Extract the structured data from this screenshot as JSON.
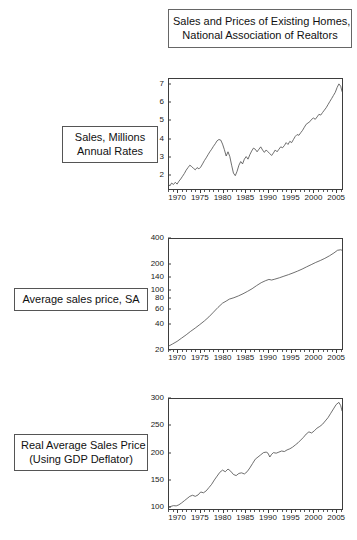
{
  "title": {
    "line1": "Sales and Prices of Existing Homes,",
    "line2": "National Association of Realtors"
  },
  "captions": [
    {
      "line1": "Sales, Millions",
      "line2": "Annual Rates"
    },
    {
      "line1": "Average sales price, SA",
      "line2": ""
    },
    {
      "line1": "Real Average Sales Price",
      "line2": "(Using GDP Deflator)"
    }
  ],
  "chart_data": [
    {
      "type": "line",
      "title": "Sales, Millions Annual Rates",
      "xlabel": "",
      "ylabel": "",
      "scale": "linear",
      "grid": false,
      "legend": null,
      "xlim": [
        1968,
        2006.5
      ],
      "ylim": [
        1.2,
        7.3
      ],
      "yticks": [
        2,
        3,
        4,
        5,
        6,
        7
      ],
      "xticks": [
        1970,
        1975,
        1980,
        1985,
        1990,
        1995,
        2000,
        2005
      ],
      "x": [
        1968.0,
        1968.4,
        1968.8,
        1969.2,
        1969.6,
        1970.0,
        1970.4,
        1970.8,
        1971.2,
        1971.6,
        1972.0,
        1972.4,
        1972.8,
        1973.2,
        1973.6,
        1974.0,
        1974.4,
        1974.8,
        1975.2,
        1975.6,
        1976.0,
        1976.4,
        1976.8,
        1977.2,
        1977.6,
        1978.0,
        1978.4,
        1978.8,
        1979.2,
        1979.6,
        1980.0,
        1980.4,
        1980.8,
        1981.2,
        1981.6,
        1982.0,
        1982.4,
        1982.8,
        1983.2,
        1983.6,
        1984.0,
        1984.4,
        1984.8,
        1985.2,
        1985.6,
        1986.0,
        1986.4,
        1986.8,
        1987.2,
        1987.6,
        1988.0,
        1988.4,
        1988.8,
        1989.2,
        1989.6,
        1990.0,
        1990.4,
        1990.8,
        1991.2,
        1991.6,
        1992.0,
        1992.4,
        1992.8,
        1993.2,
        1993.6,
        1994.0,
        1994.4,
        1994.8,
        1995.2,
        1995.6,
        1996.0,
        1996.4,
        1996.8,
        1997.2,
        1997.6,
        1998.0,
        1998.4,
        1998.8,
        1999.2,
        1999.6,
        2000.0,
        2000.4,
        2000.8,
        2001.2,
        2001.6,
        2002.0,
        2002.4,
        2002.8,
        2003.2,
        2003.6,
        2004.0,
        2004.4,
        2004.8,
        2005.2,
        2005.6,
        2006.0,
        2006.3
      ],
      "y": [
        1.55,
        1.42,
        1.58,
        1.5,
        1.62,
        1.52,
        1.68,
        1.8,
        1.95,
        2.1,
        2.28,
        2.42,
        2.55,
        2.48,
        2.38,
        2.3,
        2.42,
        2.35,
        2.45,
        2.62,
        2.8,
        2.95,
        3.12,
        3.28,
        3.42,
        3.58,
        3.72,
        3.88,
        3.95,
        3.92,
        3.7,
        3.4,
        3.05,
        3.28,
        3.02,
        2.55,
        2.12,
        1.98,
        2.22,
        2.55,
        2.75,
        2.62,
        2.88,
        3.02,
        2.88,
        3.12,
        3.32,
        3.48,
        3.42,
        3.28,
        3.42,
        3.55,
        3.38,
        3.25,
        3.38,
        3.28,
        3.18,
        3.08,
        3.22,
        3.38,
        3.28,
        3.42,
        3.55,
        3.5,
        3.62,
        3.78,
        3.68,
        3.85,
        3.78,
        3.95,
        4.12,
        4.22,
        4.18,
        4.32,
        4.45,
        4.62,
        4.78,
        4.85,
        4.92,
        5.05,
        5.12,
        5.05,
        5.18,
        5.32,
        5.28,
        5.42,
        5.55,
        5.68,
        5.85,
        6.02,
        6.18,
        6.35,
        6.52,
        6.78,
        6.98,
        6.85,
        6.55
      ]
    },
    {
      "type": "line",
      "title": "Average sales price, SA",
      "xlabel": "",
      "ylabel": "",
      "scale": "log",
      "grid": false,
      "legend": null,
      "xlim": [
        1968,
        2006.5
      ],
      "ylim": [
        20,
        400
      ],
      "yticks": [
        20,
        40,
        60,
        80,
        100,
        140,
        200,
        400
      ],
      "xticks": [
        1970,
        1975,
        1980,
        1985,
        1990,
        1995,
        2000,
        2005
      ],
      "x": [
        1968.0,
        1969.0,
        1970.0,
        1971.0,
        1972.0,
        1973.0,
        1974.0,
        1975.0,
        1976.0,
        1977.0,
        1978.0,
        1979.0,
        1980.0,
        1980.8,
        1981.5,
        1982.5,
        1983.5,
        1984.5,
        1985.5,
        1986.5,
        1987.5,
        1988.5,
        1989.5,
        1990.2,
        1990.8,
        1991.5,
        1992.5,
        1993.5,
        1994.5,
        1995.5,
        1996.5,
        1997.5,
        1998.5,
        1999.5,
        2000.5,
        2001.5,
        2002.5,
        2003.5,
        2004.5,
        2005.3,
        2006.0,
        2006.3
      ],
      "y": [
        22.0,
        23.5,
        25.2,
        27.5,
        30.0,
        33.0,
        36.0,
        39.5,
        43.5,
        48.5,
        55.0,
        62.5,
        70.0,
        74.0,
        78.0,
        81.0,
        85.0,
        90.0,
        96.0,
        103.0,
        112.0,
        121.0,
        128.0,
        132.0,
        130.0,
        133.0,
        138.0,
        144.0,
        150.0,
        157.0,
        165.0,
        174.0,
        185.0,
        196.0,
        208.0,
        219.0,
        232.0,
        248.0,
        268.0,
        288.0,
        292.0,
        288.0
      ]
    },
    {
      "type": "line",
      "title": "Real Average Sales Price (Using GDP Deflator)",
      "xlabel": "",
      "ylabel": "",
      "scale": "linear",
      "grid": false,
      "legend": null,
      "xlim": [
        1968,
        2006.5
      ],
      "ylim": [
        95,
        300
      ],
      "yticks": [
        100,
        150,
        200,
        250,
        300
      ],
      "xticks": [
        1970,
        1975,
        1980,
        1985,
        1990,
        1995,
        2000,
        2005
      ],
      "x": [
        1968.0,
        1968.6,
        1969.2,
        1969.8,
        1970.4,
        1971.0,
        1971.6,
        1972.2,
        1972.8,
        1973.4,
        1974.0,
        1974.6,
        1975.2,
        1975.8,
        1976.4,
        1977.0,
        1977.6,
        1978.2,
        1978.8,
        1979.4,
        1980.0,
        1980.6,
        1981.2,
        1981.8,
        1982.4,
        1983.0,
        1983.6,
        1984.2,
        1984.8,
        1985.4,
        1986.0,
        1986.6,
        1987.2,
        1987.8,
        1988.4,
        1989.0,
        1989.6,
        1990.0,
        1990.4,
        1990.8,
        1991.2,
        1991.8,
        1992.4,
        1993.0,
        1993.6,
        1994.2,
        1994.8,
        1995.4,
        1996.0,
        1996.6,
        1997.2,
        1997.8,
        1998.4,
        1999.0,
        1999.6,
        2000.2,
        2000.8,
        2001.4,
        2002.0,
        2002.6,
        2003.2,
        2003.8,
        2004.4,
        2005.0,
        2005.6,
        2006.0,
        2006.3
      ],
      "y": [
        100.0,
        101.5,
        103.0,
        102.5,
        104.5,
        108.0,
        112.0,
        116.0,
        120.0,
        122.0,
        120.0,
        122.5,
        128.0,
        126.5,
        130.0,
        136.0,
        142.0,
        150.0,
        157.0,
        164.0,
        168.0,
        165.0,
        170.0,
        166.0,
        160.0,
        158.0,
        162.0,
        163.0,
        161.0,
        165.0,
        172.0,
        180.0,
        188.0,
        192.0,
        196.0,
        200.0,
        201.0,
        199.0,
        192.0,
        197.0,
        200.0,
        199.0,
        201.0,
        203.0,
        202.0,
        205.0,
        207.0,
        210.0,
        214.0,
        218.0,
        223.0,
        228.0,
        234.0,
        238.0,
        236.0,
        240.0,
        245.0,
        248.0,
        252.0,
        258.0,
        264.0,
        272.0,
        280.0,
        288.0,
        292.0,
        286.0,
        276.0
      ]
    }
  ]
}
